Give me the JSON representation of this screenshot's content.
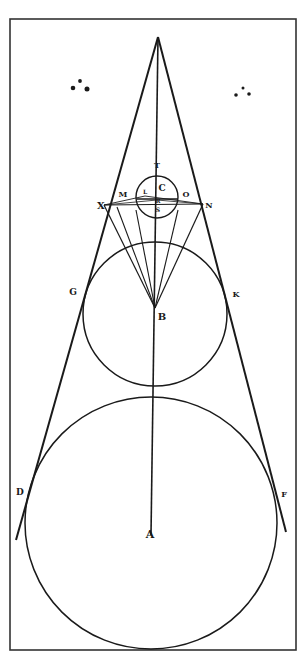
{
  "figure": {
    "ink_color": "#1a1a1a",
    "paper_color": "#ffffff",
    "frame": {
      "x": 10,
      "y": 19,
      "w": 286,
      "h": 631
    },
    "apex": {
      "x": 158,
      "y": 37
    },
    "circles": [
      {
        "id": "small",
        "center_label": "C",
        "cx": 157,
        "cy": 197,
        "r": 21
      },
      {
        "id": "middle",
        "center_label": "B",
        "cx": 155,
        "cy": 314,
        "r": 72
      },
      {
        "id": "large",
        "center_label": "A",
        "cx": 151,
        "cy": 523,
        "r": 126
      }
    ],
    "labels": [
      {
        "text": "T",
        "x": 157,
        "y": 168,
        "size": 8
      },
      {
        "text": "C",
        "x": 162,
        "y": 191,
        "size": 9
      },
      {
        "text": "L",
        "x": 145,
        "y": 194,
        "size": 6
      },
      {
        "text": "M",
        "x": 123,
        "y": 197,
        "size": 8
      },
      {
        "text": "O",
        "x": 186,
        "y": 197,
        "size": 8
      },
      {
        "text": "R",
        "x": 158,
        "y": 203,
        "size": 6
      },
      {
        "text": "S",
        "x": 158,
        "y": 212,
        "size": 6
      },
      {
        "text": "X",
        "x": 101,
        "y": 209,
        "size": 10
      },
      {
        "text": "N",
        "x": 209,
        "y": 208,
        "size": 8
      },
      {
        "text": "G",
        "x": 73,
        "y": 295,
        "size": 9
      },
      {
        "text": "K",
        "x": 236,
        "y": 297,
        "size": 8
      },
      {
        "text": "B",
        "x": 162,
        "y": 320,
        "size": 10
      },
      {
        "text": "D",
        "x": 20,
        "y": 495,
        "size": 9
      },
      {
        "text": "F",
        "x": 284,
        "y": 497,
        "size": 8
      },
      {
        "text": "A",
        "x": 150,
        "y": 538,
        "size": 11
      }
    ],
    "dots_left": [
      {
        "x": 73,
        "y": 88
      },
      {
        "x": 80,
        "y": 81
      },
      {
        "x": 87,
        "y": 89
      }
    ],
    "dots_right": [
      {
        "x": 236,
        "y": 95
      },
      {
        "x": 243,
        "y": 88
      },
      {
        "x": 249,
        "y": 94
      }
    ]
  }
}
